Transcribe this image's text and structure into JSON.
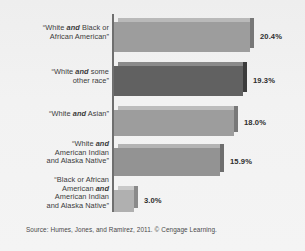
{
  "chart_data": {
    "type": "bar",
    "orientation": "horizontal",
    "title": "",
    "subtitle": "",
    "xlabel": "",
    "ylabel": "",
    "grid": false,
    "legend": null,
    "xlim": [
      0,
      22.5
    ],
    "value_suffix": "%",
    "categories": [
      "“White and Black or African American”",
      "“White and some other race”",
      "“White and Asian”",
      "“White and American Indian and Alaska Native”",
      "“Black or African American and American Indian and Alaska Native”"
    ],
    "values": [
      20.4,
      19.3,
      18.0,
      15.9,
      3.0
    ],
    "value_labels": [
      "20.4%",
      "19.3%",
      "18.0%",
      "15.9%",
      "3.0%"
    ],
    "bars": [
      {
        "label_lines": [
          {
            "segments": [
              {
                "text": "“White ",
                "bold": false
              },
              {
                "text": "and",
                "bold": true
              },
              {
                "text": " Black or",
                "bold": false
              }
            ]
          },
          {
            "segments": [
              {
                "text": "African American”",
                "bold": false
              }
            ]
          }
        ],
        "value": 20.4,
        "value_label": "20.4%",
        "color": "#9d9d9d",
        "top_color": "#b9b9b9",
        "side_color": "#777777"
      },
      {
        "label_lines": [
          {
            "segments": [
              {
                "text": "“White ",
                "bold": false
              },
              {
                "text": "and",
                "bold": true
              },
              {
                "text": " some",
                "bold": false
              }
            ]
          },
          {
            "segments": [
              {
                "text": "other race”",
                "bold": false
              }
            ]
          }
        ],
        "value": 19.3,
        "value_label": "19.3%",
        "color": "#616161",
        "top_color": "#8a8a8a",
        "side_color": "#3c3c3c"
      },
      {
        "label_lines": [
          {
            "segments": [
              {
                "text": "“White ",
                "bold": false
              },
              {
                "text": "and",
                "bold": true
              },
              {
                "text": " Asian”",
                "bold": false
              }
            ]
          }
        ],
        "value": 18.0,
        "value_label": "18.0%",
        "color": "#9d9d9d",
        "top_color": "#bcbcbc",
        "side_color": "#787878"
      },
      {
        "label_lines": [
          {
            "segments": [
              {
                "text": "“White ",
                "bold": false
              },
              {
                "text": "and",
                "bold": true
              }
            ]
          },
          {
            "segments": [
              {
                "text": "American Indian",
                "bold": false
              }
            ]
          },
          {
            "segments": [
              {
                "text": "and Alaska Native”",
                "bold": false
              }
            ]
          }
        ],
        "value": 15.9,
        "value_label": "15.9%",
        "color": "#939393",
        "top_color": "#b4b4b4",
        "side_color": "#6e6e6e"
      },
      {
        "label_lines": [
          {
            "segments": [
              {
                "text": "“Black or African",
                "bold": false
              }
            ]
          },
          {
            "segments": [
              {
                "text": "American ",
                "bold": false
              },
              {
                "text": "and",
                "bold": true
              }
            ]
          },
          {
            "segments": [
              {
                "text": "American Indian",
                "bold": false
              }
            ]
          },
          {
            "segments": [
              {
                "text": "and Alaska Native”",
                "bold": false
              }
            ]
          }
        ],
        "value": 3.0,
        "value_label": "3.0%",
        "color": "#b0b0b0",
        "top_color": "#c9c9c9",
        "side_color": "#8a8a8a"
      }
    ]
  },
  "source": {
    "text": "Source: Humes, Jones, and Ramirez, 2011. © Cengage Learning."
  },
  "colors": {
    "background": "#f1f1f1",
    "axis": "#6f6f6f",
    "label_text": "#3b3b3b",
    "value_text": "#2e2e2e",
    "source_text": "#4a4a4a",
    "highlight_bar": "#616161",
    "default_bar": "#9d9d9d"
  }
}
